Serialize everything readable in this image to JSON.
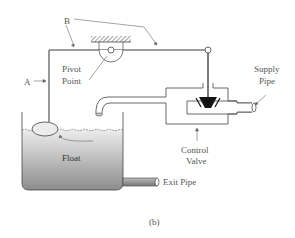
{
  "diagram": {
    "caption": "(b)",
    "labels": {
      "a": "A",
      "b": "B",
      "pivot_line1": "Pivot",
      "pivot_line2": "Point",
      "supply_line1": "Supply",
      "supply_line2": "Pipe",
      "float": "Float",
      "control_line1": "Control",
      "control_line2": "Valve",
      "exit": "Exit Pipe"
    },
    "colors": {
      "line": "#444444",
      "water_top": "#e6e6e6",
      "water_bottom": "#8f8f8f",
      "valve_plug": "#111111"
    }
  }
}
